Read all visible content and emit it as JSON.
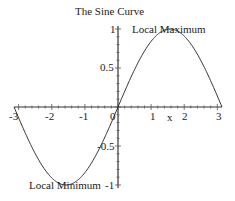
{
  "chart_data": {
    "type": "line",
    "title": "The Sine Curve",
    "xlabel": "x",
    "ylabel": "",
    "xlim": [
      -3.14159,
      3.14159
    ],
    "ylim": [
      -1,
      1
    ],
    "x_ticks": [
      "-3",
      "-2",
      "-1",
      "0",
      "1",
      "2",
      "3"
    ],
    "y_ticks": [
      "1",
      "0.5",
      "-0.5",
      "-1"
    ],
    "grid": false,
    "legend": null,
    "series": [
      {
        "name": "sin(x)",
        "function": "sin(x)",
        "color": "#333333",
        "x": [
          -3.14,
          -2.5,
          -2.0,
          -1.57,
          -1.0,
          -0.5,
          0,
          0.5,
          1.0,
          1.57,
          2.0,
          2.5,
          3.14
        ],
        "y": [
          0,
          -0.6,
          -0.91,
          -1,
          -0.84,
          -0.48,
          0,
          0.48,
          0.84,
          1,
          0.91,
          0.6,
          0
        ]
      }
    ],
    "annotations": [
      {
        "text": "Local Maximum",
        "x": 1.57,
        "y": 1
      },
      {
        "text": "Local Minimum",
        "x": -1.57,
        "y": -1
      }
    ]
  }
}
